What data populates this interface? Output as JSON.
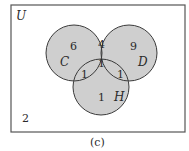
{
  "universe_label": "U",
  "sets": [
    {
      "label": "C",
      "cx": 74,
      "cy": 53,
      "r": 28
    },
    {
      "label": "D",
      "cx": 129,
      "cy": 53,
      "r": 28
    },
    {
      "label": "H",
      "cx": 101,
      "cy": 87,
      "r": 28
    }
  ],
  "regions": {
    "c_only": "6",
    "d_only": "9",
    "h_only": "1",
    "c_and_d": "4",
    "c_and_h": "1",
    "d_and_h": "1",
    "c_d_h": "1",
    "outside": "2"
  },
  "caption": "(c)",
  "colors": {
    "fill": "#cfcfcf",
    "stroke": "#3a3a3a"
  }
}
